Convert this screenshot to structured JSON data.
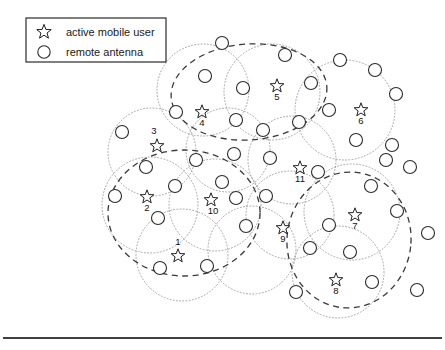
{
  "figure": {
    "width": 445,
    "height": 350,
    "background_color": "#ffffff"
  },
  "legend": {
    "box": {
      "x": 26,
      "y": 18,
      "width": 140,
      "height": 44
    },
    "items": [
      {
        "symbol": "star-icon",
        "label": "active mobile user",
        "sx": 44,
        "sy": 32,
        "tx": 66,
        "ty": 36
      },
      {
        "symbol": "circle-icon",
        "label": "remote antenna",
        "sx": 44,
        "sy": 52,
        "tx": 66,
        "ty": 56
      }
    ]
  },
  "colors": {
    "antenna_stroke": "#2b2b2b",
    "star_stroke": "#1f1f1f",
    "coverage_stroke": "#9a9a9a",
    "cluster_stroke": "#3a3a3a",
    "label_fill": "#111111",
    "rule_stroke": "#000000"
  },
  "chart_data": {
    "type": "scatter",
    "xlabel": "",
    "ylabel": "",
    "xlim": [
      0,
      445
    ],
    "ylim": [
      0,
      350
    ],
    "grid": false,
    "legend_position": "top-left",
    "series": [
      {
        "name": "active mobile user",
        "marker": "star",
        "points": [
          {
            "label": "1",
            "x": 178,
            "y": 256,
            "lx": 178,
            "ly": 245
          },
          {
            "label": "2",
            "x": 147,
            "y": 197,
            "lx": 147,
            "ly": 211
          },
          {
            "label": "3",
            "x": 157,
            "y": 146,
            "lx": 154,
            "ly": 134
          },
          {
            "label": "4",
            "x": 202,
            "y": 112,
            "lx": 202,
            "ly": 126
          },
          {
            "label": "5",
            "x": 277,
            "y": 86,
            "lx": 277,
            "ly": 100
          },
          {
            "label": "6",
            "x": 361,
            "y": 110,
            "lx": 361,
            "ly": 124
          },
          {
            "label": "7",
            "x": 355,
            "y": 215,
            "lx": 355,
            "ly": 229
          },
          {
            "label": "8",
            "x": 336,
            "y": 280,
            "lx": 336,
            "ly": 294
          },
          {
            "label": "9",
            "x": 283,
            "y": 228,
            "lx": 283,
            "ly": 242
          },
          {
            "label": "10",
            "x": 211,
            "y": 200,
            "lx": 213,
            "ly": 214
          },
          {
            "label": "11",
            "x": 300,
            "y": 168,
            "lx": 300,
            "ly": 182
          }
        ]
      },
      {
        "name": "remote antenna",
        "marker": "circle",
        "radius": 6.5,
        "points": [
          {
            "x": 222,
            "y": 43
          },
          {
            "x": 285,
            "y": 55
          },
          {
            "x": 340,
            "y": 60
          },
          {
            "x": 375,
            "y": 70
          },
          {
            "x": 205,
            "y": 76
          },
          {
            "x": 243,
            "y": 88
          },
          {
            "x": 311,
            "y": 83
          },
          {
            "x": 396,
            "y": 94
          },
          {
            "x": 329,
            "y": 110
          },
          {
            "x": 122,
            "y": 132
          },
          {
            "x": 176,
            "y": 112
          },
          {
            "x": 236,
            "y": 120
          },
          {
            "x": 299,
            "y": 122
          },
          {
            "x": 263,
            "y": 130
          },
          {
            "x": 356,
            "y": 140
          },
          {
            "x": 392,
            "y": 145
          },
          {
            "x": 115,
            "y": 196
          },
          {
            "x": 146,
            "y": 167
          },
          {
            "x": 196,
            "y": 160
          },
          {
            "x": 234,
            "y": 154
          },
          {
            "x": 270,
            "y": 158
          },
          {
            "x": 318,
            "y": 172
          },
          {
            "x": 410,
            "y": 167
          },
          {
            "x": 175,
            "y": 186
          },
          {
            "x": 222,
            "y": 182
          },
          {
            "x": 371,
            "y": 186
          },
          {
            "x": 158,
            "y": 218
          },
          {
            "x": 236,
            "y": 198
          },
          {
            "x": 246,
            "y": 226
          },
          {
            "x": 329,
            "y": 225
          },
          {
            "x": 397,
            "y": 211
          },
          {
            "x": 266,
            "y": 196
          },
          {
            "x": 310,
            "y": 248
          },
          {
            "x": 350,
            "y": 252
          },
          {
            "x": 428,
            "y": 233
          },
          {
            "x": 160,
            "y": 268
          },
          {
            "x": 207,
            "y": 266
          },
          {
            "x": 296,
            "y": 292
          },
          {
            "x": 372,
            "y": 282
          },
          {
            "x": 417,
            "y": 290
          },
          {
            "x": 386,
            "y": 160
          }
        ]
      }
    ],
    "coverage_cells": [
      {
        "cx": 203,
        "cy": 90,
        "r": 46
      },
      {
        "cx": 272,
        "cy": 92,
        "r": 48
      },
      {
        "cx": 345,
        "cy": 110,
        "r": 50
      },
      {
        "cx": 152,
        "cy": 152,
        "r": 44
      },
      {
        "cx": 228,
        "cy": 150,
        "r": 42
      },
      {
        "cx": 292,
        "cy": 160,
        "r": 44
      },
      {
        "cx": 150,
        "cy": 205,
        "r": 48
      },
      {
        "cx": 215,
        "cy": 205,
        "r": 46
      },
      {
        "cx": 290,
        "cy": 215,
        "r": 44
      },
      {
        "cx": 352,
        "cy": 212,
        "r": 48
      },
      {
        "cx": 182,
        "cy": 255,
        "r": 46
      },
      {
        "cx": 252,
        "cy": 250,
        "r": 44
      },
      {
        "cx": 338,
        "cy": 272,
        "r": 46
      }
    ],
    "clusters": [
      {
        "name": "cluster-top",
        "cx": 249,
        "cy": 92,
        "rx": 78,
        "ry": 48,
        "rotate": -4
      },
      {
        "name": "cluster-left",
        "cx": 184,
        "cy": 213,
        "rx": 76,
        "ry": 63,
        "rotate": 0
      },
      {
        "name": "cluster-right",
        "cx": 349,
        "cy": 240,
        "rx": 62,
        "ry": 68,
        "rotate": 6
      }
    ],
    "annotations": [
      {
        "name": "bottom-rule",
        "x1": 3,
        "y1": 338,
        "x2": 442,
        "y2": 338
      }
    ]
  }
}
